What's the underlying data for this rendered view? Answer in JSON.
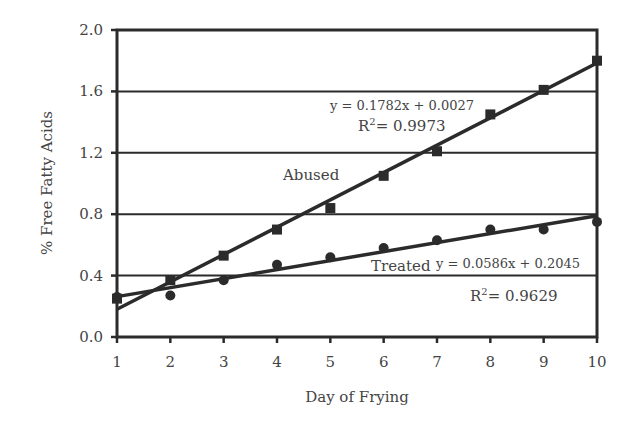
{
  "chart_data": {
    "type": "scatter",
    "title": "",
    "xlabel": "Day of Frying",
    "ylabel": "% Free Fatty Acids",
    "xlim": [
      1,
      10
    ],
    "ylim": [
      0.0,
      2.0
    ],
    "x_ticks": [
      "1",
      "2",
      "3",
      "4",
      "5",
      "6",
      "7",
      "8",
      "9",
      "10"
    ],
    "y_ticks": [
      "0.0",
      "0.4",
      "0.8",
      "1.2",
      "1.6",
      "2.0"
    ],
    "grid": "horizontal",
    "x": [
      1,
      2,
      3,
      4,
      5,
      6,
      7,
      8,
      9,
      10
    ],
    "series": [
      {
        "name": "Abused",
        "marker": "square",
        "values": [
          0.25,
          0.37,
          0.53,
          0.7,
          0.84,
          1.05,
          1.21,
          1.45,
          1.61,
          1.8
        ],
        "trendline": {
          "slope": 0.1782,
          "intercept": 0.0027,
          "equation": "y = 0.1782x + 0.0027",
          "r2": "0.9973"
        }
      },
      {
        "name": "Treated",
        "marker": "circle",
        "values": [
          0.26,
          0.27,
          0.37,
          0.47,
          0.52,
          0.58,
          0.63,
          0.7,
          0.7,
          0.75
        ],
        "trendline": {
          "slope": 0.0586,
          "intercept": 0.2045,
          "equation": "y = 0.0586x + 0.2045",
          "r2": "0.9629"
        }
      }
    ],
    "annotations": [
      {
        "text": "Abused",
        "near": "abused-line"
      },
      {
        "text": "Treated",
        "near": "treated-line"
      },
      {
        "text": "y = 0.1782x + 0.0027"
      },
      {
        "text": "R2= 0.9973"
      },
      {
        "text": "y = 0.0586x + 0.2045"
      },
      {
        "text": "R2= 0.9629"
      }
    ]
  },
  "labels": {
    "abused": "Abused",
    "treated": "Treated",
    "abused_eq": "y = 0.1782x + 0.0027",
    "abused_r2_prefix": "R",
    "abused_r2_sup": "2",
    "abused_r2_value": "= 0.9973",
    "treated_eq": "y = 0.0586x + 0.2045",
    "treated_r2_prefix": "R",
    "treated_r2_sup": "2",
    "treated_r2_value": "= 0.9629"
  },
  "colors": {
    "ink": "#2b2b2b",
    "text": "#444444",
    "background": "#ffffff"
  }
}
